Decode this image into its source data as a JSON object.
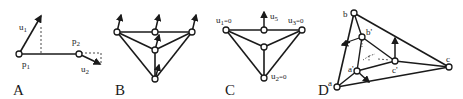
{
  "figure": {
    "panels": [
      {
        "id": "A",
        "label": "A",
        "points": [
          {
            "name": "p1",
            "text": "p",
            "sub": "1"
          },
          {
            "name": "p2",
            "text": "p",
            "sub": "2"
          }
        ],
        "vectors": [
          {
            "name": "u1",
            "text": "u",
            "sub": "1"
          },
          {
            "name": "u2",
            "text": "u",
            "sub": "2"
          }
        ]
      },
      {
        "id": "B",
        "label": "B"
      },
      {
        "id": "C",
        "label": "C",
        "annotations": [
          {
            "name": "u1",
            "text": "u",
            "sub": "1",
            "suffix": "=0"
          },
          {
            "name": "u5",
            "text": "u",
            "sub": "5",
            "suffix": ""
          },
          {
            "name": "u3",
            "text": "u",
            "sub": "3",
            "suffix": "=0"
          },
          {
            "name": "u2",
            "text": "u",
            "sub": "2",
            "suffix": "=0"
          }
        ]
      },
      {
        "id": "D",
        "label": "D",
        "vertices": [
          "a",
          "b",
          "c",
          "a'",
          "b'",
          "c'"
        ]
      }
    ],
    "colors": {
      "ink": "#1a1a1a",
      "background": "#ffffff"
    }
  }
}
